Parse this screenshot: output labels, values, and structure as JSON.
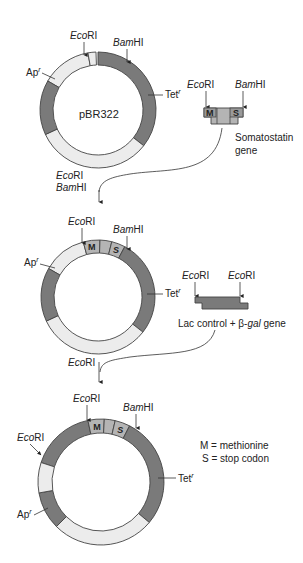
{
  "colors": {
    "dark_segment": "#7a7a7a",
    "light_segment": "#ececec",
    "insert_segment": "#b4b4b4",
    "outline": "#444444",
    "text": "#222222"
  },
  "stage1": {
    "plasmid_name": "pBR322",
    "labels": {
      "ecori": {
        "italic": "Eco",
        "plain": "RI"
      },
      "bamhi": {
        "italic": "Bam",
        "plain": "HI"
      },
      "ampr": {
        "main": "Ap",
        "sup": "r"
      },
      "tetr": {
        "main": "Tet",
        "sup": "r"
      }
    },
    "fragment": {
      "name_line1": "Somatostatin",
      "name_line2": "gene",
      "left_site": {
        "italic": "Eco",
        "plain": "RI"
      },
      "right_site": {
        "italic": "Bam",
        "plain": "HI"
      },
      "m_label": "M",
      "s_label": "S"
    },
    "transition": {
      "line1": {
        "italic": "Eco",
        "plain": "RI"
      },
      "line2": {
        "italic": "Bam",
        "plain": "HI"
      }
    }
  },
  "stage2": {
    "labels": {
      "ecori": {
        "italic": "Eco",
        "plain": "RI"
      },
      "bamhi": {
        "italic": "Bam",
        "plain": "HI"
      },
      "ampr": {
        "main": "Ap",
        "sup": "r"
      },
      "tetr": {
        "main": "Tet",
        "sup": "r"
      },
      "m_label": "M",
      "s_label": "S"
    },
    "fragment": {
      "name_prefix": "Lac control + β-",
      "name_italic": "gal",
      "name_suffix": " gene",
      "left_site": {
        "italic": "Eco",
        "plain": "RI"
      },
      "right_site": {
        "italic": "Eco",
        "plain": "RI"
      }
    },
    "transition": {
      "line1": {
        "italic": "Eco",
        "plain": "RI"
      }
    }
  },
  "stage3": {
    "labels": {
      "ecori_top": {
        "italic": "Eco",
        "plain": "RI"
      },
      "ecori_left": {
        "italic": "Eco",
        "plain": "RI"
      },
      "bamhi": {
        "italic": "Bam",
        "plain": "HI"
      },
      "ampr": {
        "main": "Ap",
        "sup": "r"
      },
      "tetr": {
        "main": "Tet",
        "sup": "r"
      },
      "m_label": "M",
      "s_label": "S"
    },
    "legend": {
      "line1": "M = methionine",
      "line2": "S = stop codon"
    }
  }
}
